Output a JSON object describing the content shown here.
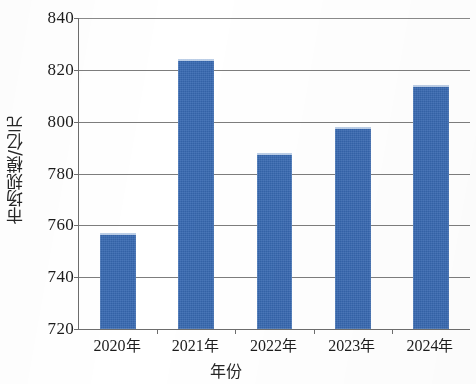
{
  "chart_data": {
    "type": "bar",
    "title": "",
    "subtitle": "",
    "xlabel": "年份",
    "ylabel": "市场规模/亿元",
    "categories": [
      "2020年",
      "2021年",
      "2022年",
      "2023年",
      "2024年"
    ],
    "values": [
      757,
      824,
      788,
      798,
      814
    ],
    "series": [
      {
        "name": "市场规模",
        "values": [
          757,
          824,
          788,
          798,
          814
        ]
      }
    ],
    "ylim": [
      720,
      840
    ],
    "yticks": [
      720,
      740,
      760,
      780,
      800,
      820,
      840
    ],
    "ytick_labels": [
      "720",
      "740",
      "760",
      "780",
      "800",
      "820",
      "840"
    ],
    "grid": true,
    "grid_axis": "y",
    "legend": false,
    "legend_position": "none",
    "bar_color": "#3769b2",
    "axis_color": "#6d6d6d",
    "grid_color": "#7d7d7d",
    "background_color": "#ffffff",
    "bar_width_ratio": 0.46,
    "annotations": []
  },
  "axis": {
    "y_title": "市场规模/亿元",
    "x_title": "年份"
  }
}
